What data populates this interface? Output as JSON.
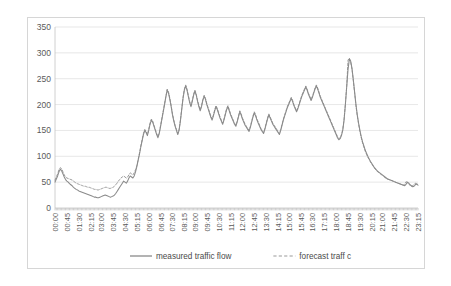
{
  "chart_data": {
    "type": "line",
    "title": "",
    "xlabel": "",
    "ylabel": "",
    "ylim": [
      0,
      350
    ],
    "ytick_step": 50,
    "yticks": [
      "0",
      "50",
      "100",
      "150",
      "200",
      "250",
      "300",
      "350"
    ],
    "grid": true,
    "legend_position": "bottom",
    "x_tick_labels": [
      "00:00",
      "00:45",
      "01:30",
      "02:15",
      "03:00",
      "03:45",
      "04:30",
      "05:15",
      "06:00",
      "06:45",
      "07:30",
      "08:15",
      "09:00",
      "09:45",
      "10:30",
      "11:15",
      "12:00",
      "12:45",
      "13:30",
      "14:15",
      "15:00",
      "15:45",
      "16:30",
      "17:15",
      "18:00",
      "18:45",
      "19:30",
      "20:15",
      "21:00",
      "21:45",
      "22:30",
      "23:15"
    ],
    "x_tick_interval_minutes": 45,
    "sample_interval_minutes": 5,
    "colors": {
      "measured": "#8a8a8a",
      "forecast": "#9a9a9a",
      "grid": "#dcdcdc",
      "axis": "#c4c4c4",
      "border": "#d6d6d6",
      "text": "#5a5a5a"
    },
    "series": [
      {
        "name": "measured traffic flow",
        "style": "solid",
        "values": [
          50,
          56,
          62,
          70,
          75,
          72,
          66,
          60,
          55,
          52,
          50,
          47,
          45,
          43,
          40,
          38,
          36,
          35,
          33,
          32,
          31,
          30,
          29,
          28,
          27,
          26,
          25,
          24,
          23,
          22,
          21,
          21,
          20,
          20,
          21,
          22,
          23,
          24,
          25,
          24,
          23,
          22,
          21,
          22,
          23,
          25,
          28,
          32,
          36,
          40,
          44,
          48,
          52,
          50,
          48,
          52,
          58,
          62,
          60,
          58,
          62,
          70,
          80,
          92,
          104,
          118,
          130,
          142,
          150,
          146,
          140,
          150,
          162,
          170,
          166,
          158,
          150,
          142,
          136,
          144,
          158,
          172,
          186,
          200,
          215,
          228,
          222,
          210,
          196,
          180,
          168,
          158,
          150,
          142,
          150,
          168,
          190,
          212,
          228,
          236,
          228,
          216,
          204,
          196,
          206,
          218,
          226,
          218,
          206,
          196,
          188,
          196,
          208,
          216,
          210,
          200,
          192,
          184,
          176,
          170,
          178,
          188,
          196,
          190,
          182,
          174,
          168,
          162,
          170,
          180,
          190,
          196,
          188,
          180,
          174,
          168,
          162,
          158,
          166,
          176,
          186,
          180,
          172,
          166,
          160,
          156,
          152,
          148,
          156,
          166,
          176,
          184,
          178,
          170,
          164,
          158,
          152,
          148,
          144,
          152,
          162,
          172,
          180,
          174,
          168,
          162,
          158,
          154,
          150,
          146,
          142,
          150,
          160,
          170,
          178,
          186,
          194,
          200,
          206,
          212,
          206,
          198,
          192,
          186,
          192,
          200,
          208,
          216,
          222,
          228,
          234,
          228,
          220,
          214,
          208,
          214,
          222,
          230,
          236,
          230,
          222,
          214,
          208,
          202,
          196,
          190,
          184,
          178,
          172,
          166,
          160,
          154,
          148,
          142,
          136,
          132,
          134,
          140,
          150,
          170,
          200,
          235,
          268,
          288,
          284,
          270,
          248,
          224,
          200,
          180,
          164,
          150,
          138,
          128,
          120,
          112,
          106,
          100,
          95,
          90,
          86,
          82,
          78,
          75,
          72,
          70,
          68,
          66,
          64,
          62,
          60,
          58,
          56,
          55,
          54,
          53,
          52,
          51,
          50,
          49,
          48,
          47,
          46,
          45,
          44,
          43,
          46,
          50,
          48,
          45,
          43,
          41,
          42,
          45,
          47,
          44
        ]
      },
      {
        "name": "forecast traffic",
        "style": "dashed",
        "values": [
          54,
          60,
          66,
          74,
          78,
          76,
          70,
          64,
          60,
          58,
          57,
          56,
          55,
          54,
          52,
          50,
          48,
          47,
          46,
          45,
          44,
          43,
          42,
          42,
          41,
          40,
          40,
          39,
          38,
          37,
          36,
          36,
          35,
          35,
          36,
          37,
          38,
          39,
          40,
          40,
          39,
          38,
          38,
          39,
          40,
          42,
          45,
          48,
          52,
          55,
          58,
          60,
          62,
          60,
          58,
          60,
          64,
          68,
          66,
          64,
          68,
          74,
          82,
          94,
          106,
          120,
          132,
          144,
          152,
          148,
          142,
          152,
          164,
          172,
          168,
          160,
          152,
          144,
          138,
          146,
          160,
          174,
          188,
          202,
          216,
          230,
          224,
          212,
          198,
          182,
          170,
          160,
          152,
          144,
          152,
          170,
          192,
          214,
          230,
          238,
          230,
          218,
          206,
          198,
          208,
          220,
          228,
          220,
          208,
          198,
          190,
          198,
          210,
          218,
          212,
          202,
          194,
          186,
          178,
          172,
          180,
          190,
          198,
          192,
          184,
          176,
          170,
          164,
          172,
          182,
          192,
          198,
          190,
          182,
          176,
          170,
          164,
          160,
          168,
          178,
          188,
          182,
          174,
          168,
          162,
          158,
          154,
          150,
          158,
          168,
          178,
          186,
          180,
          172,
          166,
          160,
          154,
          150,
          146,
          154,
          164,
          174,
          182,
          176,
          170,
          164,
          160,
          156,
          152,
          148,
          144,
          152,
          162,
          172,
          180,
          188,
          196,
          202,
          208,
          214,
          208,
          200,
          194,
          188,
          194,
          202,
          210,
          218,
          224,
          230,
          236,
          230,
          222,
          216,
          210,
          216,
          224,
          232,
          238,
          232,
          224,
          216,
          210,
          204,
          198,
          192,
          186,
          180,
          174,
          168,
          162,
          156,
          150,
          144,
          138,
          134,
          136,
          142,
          152,
          172,
          202,
          236,
          286,
          290,
          282,
          268,
          246,
          222,
          198,
          178,
          162,
          148,
          136,
          126,
          118,
          110,
          104,
          98,
          94,
          89,
          85,
          81,
          77,
          74,
          71,
          69,
          67,
          65,
          63,
          61,
          59,
          57,
          56,
          55,
          54,
          53,
          52,
          51,
          50,
          49,
          48,
          47,
          46,
          45,
          44,
          47,
          51,
          49,
          46,
          44,
          42,
          43,
          46,
          48,
          45
        ]
      }
    ]
  },
  "legend": {
    "items": [
      {
        "label": "measured traffic flow",
        "style": "solid"
      },
      {
        "label": "forecast traff c",
        "style": "dashed"
      }
    ]
  }
}
